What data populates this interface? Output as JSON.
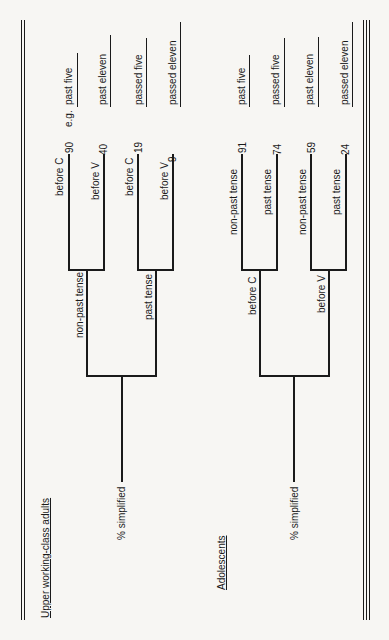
{
  "diagram": {
    "orientation": "rotated -90deg (reads bottom-to-top)",
    "groups": [
      {
        "title": "Upper working-class adults",
        "root_label": "% simplified",
        "level1": [
          {
            "label": "non-past tense",
            "leaves": [
              {
                "label": "before C",
                "value": "90",
                "example": "past five"
              },
              {
                "label": "before V",
                "value": "40",
                "example": "past eleven"
              }
            ]
          },
          {
            "label": "past tense",
            "leaves": [
              {
                "label": "before C",
                "value": "19",
                "example": "passed five"
              },
              {
                "label": "before V",
                "value": "9",
                "example": "passed eleven"
              }
            ]
          }
        ]
      },
      {
        "title": "Adolescents",
        "root_label": "% simplified",
        "level1": [
          {
            "label": "before C",
            "leaves": [
              {
                "label": "non-past tense",
                "value": "91",
                "example": "past five"
              },
              {
                "label": "past tense",
                "value": "74",
                "example": "passed five"
              }
            ]
          },
          {
            "label": "before V",
            "leaves": [
              {
                "label": "non-past tense",
                "value": "59",
                "example": "past eleven"
              },
              {
                "label": "past tense",
                "value": "24",
                "example": "passed eleven"
              }
            ]
          }
        ]
      }
    ],
    "example_prefix": "e.g."
  }
}
